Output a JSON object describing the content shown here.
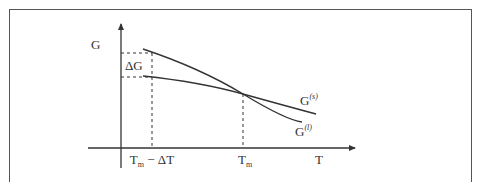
{
  "diagram": {
    "y_axis_label": "G",
    "x_axis_label": "T",
    "delta_g_label": "ΔG",
    "tick_labels": {
      "tm_minus_dt": {
        "base": "T",
        "sub": "m",
        "rest": " − ΔT"
      },
      "tm": {
        "base": "T",
        "sub": "m"
      }
    },
    "curves": [
      {
        "name": "solid",
        "label_base": "G",
        "label_sup": "(s)"
      },
      {
        "name": "liquid",
        "label_base": "G",
        "label_sup": "(l)"
      }
    ],
    "colors": {
      "line": "#333333",
      "frame": "#555555"
    }
  }
}
